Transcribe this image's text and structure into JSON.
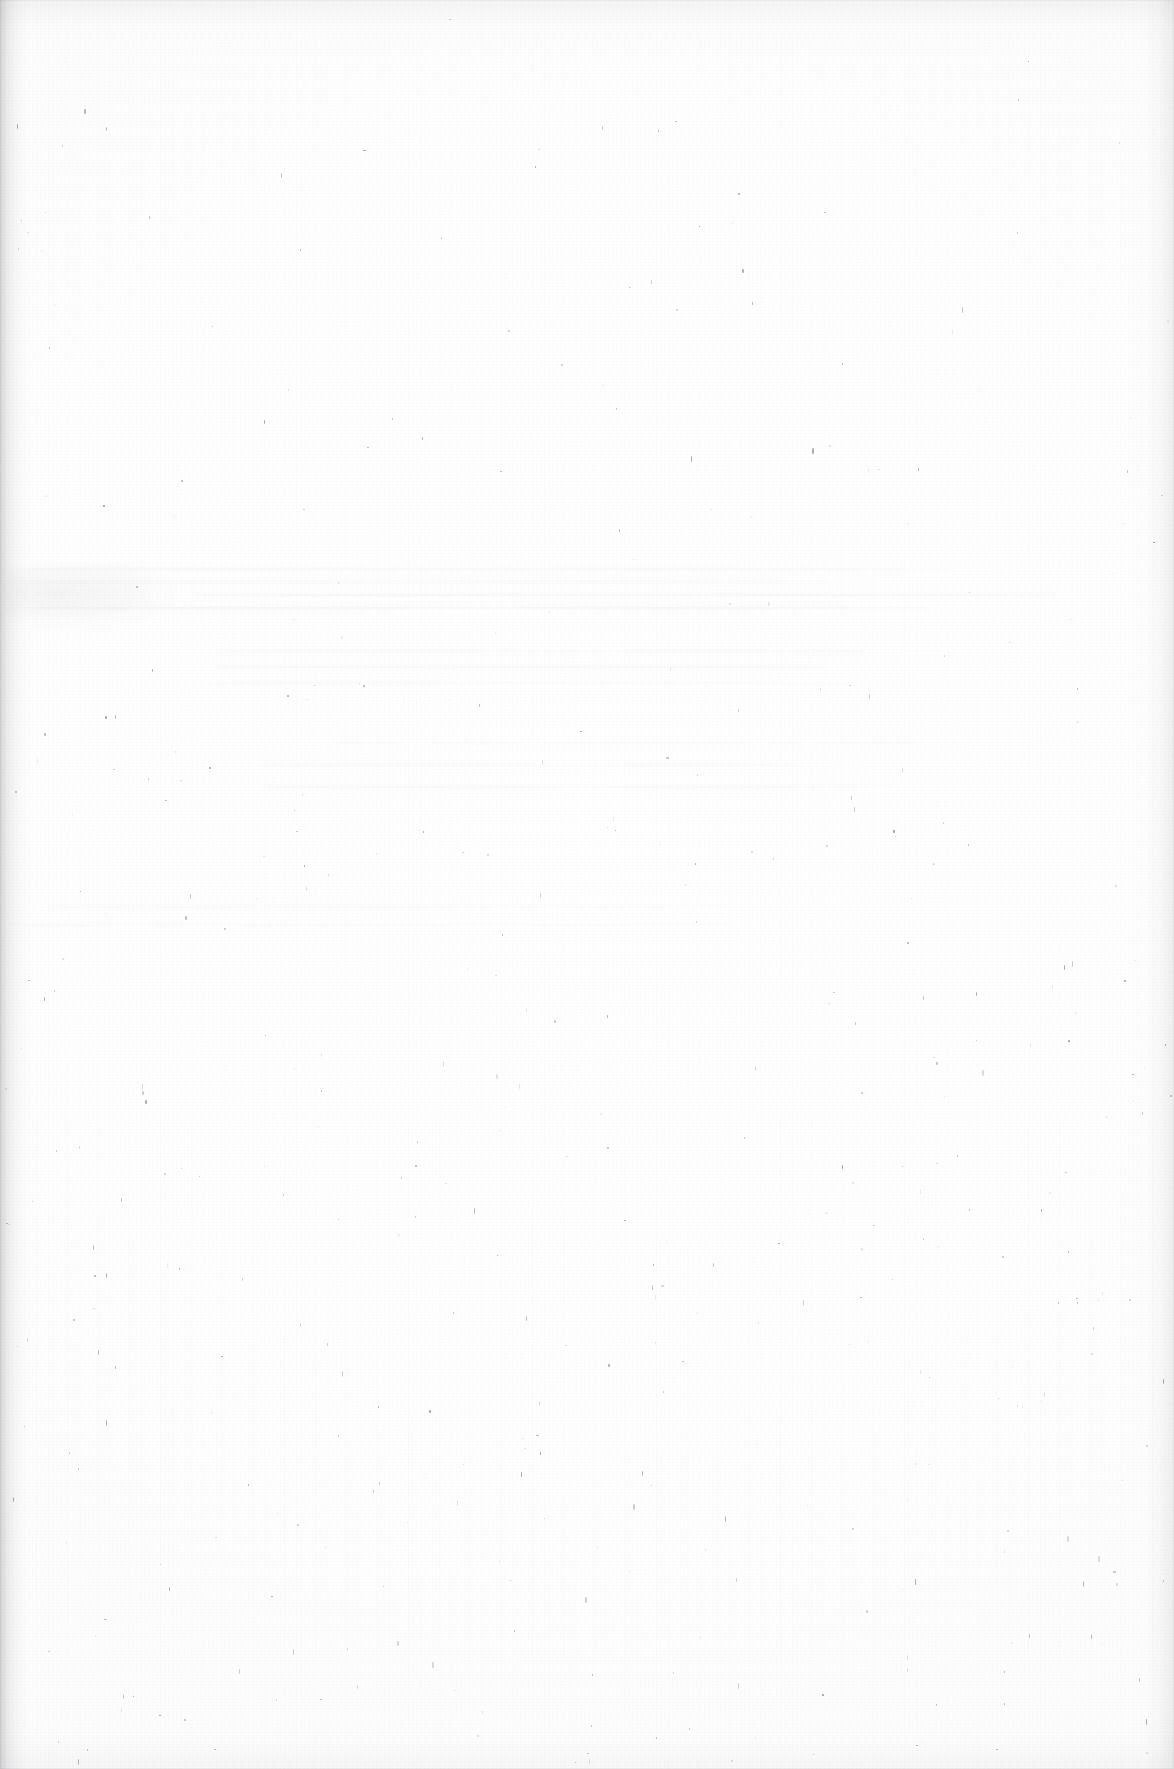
{
  "document": {
    "kind": "scanned-page",
    "page_state": "blank",
    "visible_text": "",
    "notes_rendered_on_page": []
  },
  "canvas": {
    "width": 1174,
    "height": 1769
  },
  "colors": {
    "paper": "#fdfdfd",
    "paper_highlight": "#ffffff",
    "paper_shadow": "#fbfbfb",
    "gutter_shadow": "#787a7e",
    "edge_shadow": "#a0a2a6",
    "speck": "#6f7176",
    "ghost_text": "#3c3e46",
    "page_outline": "rgba(0,0,0,0.045)"
  },
  "artifacts": {
    "gutter_left": {
      "x": 0,
      "width": 34,
      "opacity": 0.3
    },
    "gutter_right": {
      "x": 1128,
      "width": 46,
      "opacity": 0.16
    },
    "edge_top": {
      "height": 56,
      "opacity": 0.1
    },
    "edge_bottom": {
      "height": 64,
      "opacity": 0.08
    },
    "ghost_blob": {
      "x": 6,
      "y": 566,
      "width": 170,
      "height": 60,
      "opacity": 0.055
    },
    "ghost_bands": [
      {
        "top": 568,
        "lines": 4,
        "spacing": 13,
        "opacity": 0.95,
        "left": 0,
        "right": 1174
      },
      {
        "top": 650,
        "lines": 3,
        "spacing": 16,
        "opacity": 0.6,
        "left": 200,
        "right": 1060
      },
      {
        "top": 742,
        "lines": 3,
        "spacing": 22,
        "opacity": 0.5,
        "left": 250,
        "right": 1060
      },
      {
        "top": 906,
        "lines": 2,
        "spacing": 18,
        "opacity": 0.42,
        "left": 0,
        "right": 820
      }
    ],
    "speck_count": 420,
    "speck_density_bias": "lower-half",
    "grain_opacity": 0.55,
    "streak_opacity": 0.5
  }
}
